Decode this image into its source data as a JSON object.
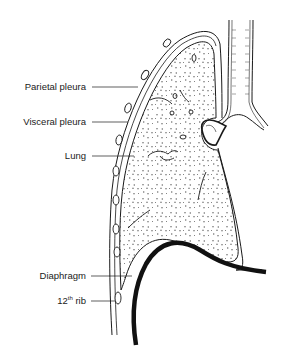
{
  "diagram": {
    "title": "",
    "labels": [
      {
        "id": "parietal-pleura",
        "text": "Parietal pleura"
      },
      {
        "id": "visceral-pleura",
        "text": "Visceral pleura"
      },
      {
        "id": "lung",
        "text": "Lung"
      },
      {
        "id": "diaphragm",
        "text": "Diaphragm"
      },
      {
        "id": "rib",
        "text_main": "12",
        "text_sup": "th",
        "text_tail": " rib"
      }
    ],
    "colors": {
      "line": "#1a1a1a",
      "lung_fill": "#ffffff",
      "background": "#ffffff"
    }
  }
}
